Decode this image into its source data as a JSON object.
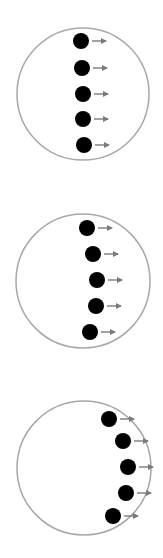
{
  "colors": {
    "background": "#ffffff",
    "circle_stroke": "#a8a8a8",
    "dot_fill": "#000000",
    "arrow": "#7a7a7a"
  },
  "panels": [
    {
      "name": "panel-1",
      "circle": {
        "cx": 83,
        "cy": 94,
        "r": 66
      },
      "dots": [
        {
          "cx": 81,
          "cy": 41
        },
        {
          "cx": 82,
          "cy": 68
        },
        {
          "cx": 83,
          "cy": 94
        },
        {
          "cx": 83,
          "cy": 119
        },
        {
          "cx": 84,
          "cy": 145
        }
      ]
    },
    {
      "name": "panel-2",
      "circle": {
        "cx": 83,
        "cy": 281,
        "r": 67
      },
      "dots": [
        {
          "cx": 87,
          "cy": 228
        },
        {
          "cx": 93,
          "cy": 254
        },
        {
          "cx": 97,
          "cy": 280
        },
        {
          "cx": 96,
          "cy": 306
        },
        {
          "cx": 90,
          "cy": 332
        }
      ]
    },
    {
      "name": "panel-3",
      "circle": {
        "cx": 84,
        "cy": 468,
        "r": 67
      },
      "dots": [
        {
          "cx": 109,
          "cy": 419
        },
        {
          "cx": 123,
          "cy": 441
        },
        {
          "cx": 128,
          "cy": 467
        },
        {
          "cx": 126,
          "cy": 493
        },
        {
          "cx": 113,
          "cy": 516
        }
      ]
    }
  ],
  "dot_radius": 8,
  "arrow_length": 14,
  "arrow_gap": 3
}
